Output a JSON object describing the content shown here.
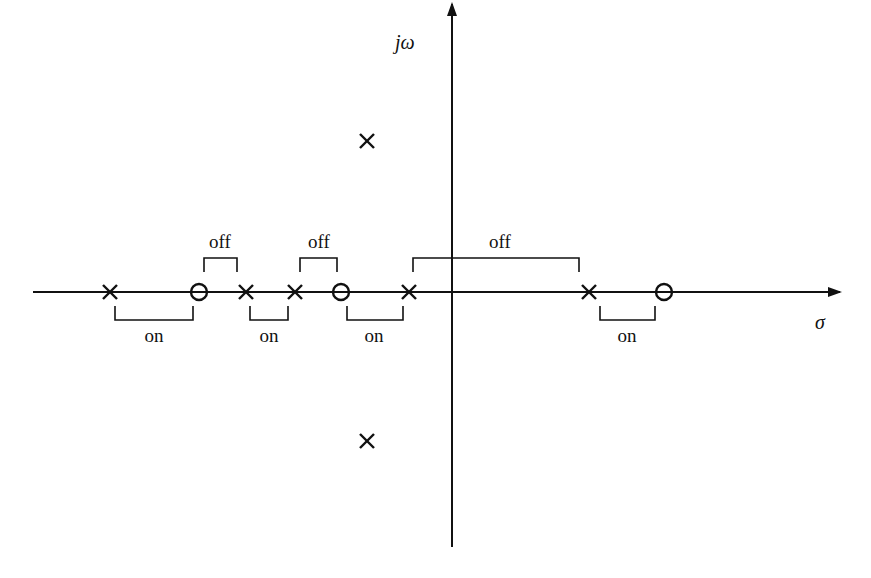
{
  "diagram": {
    "colors": {
      "stroke": "#111111",
      "background": "#ffffff"
    },
    "axes": {
      "real_axis_label": "σ",
      "imag_axis_label": "jω",
      "origin_px": [
        452,
        292
      ],
      "real_axis_px": {
        "x_start": 33,
        "x_end": 840
      },
      "imag_axis_px": {
        "y_top": 4,
        "y_bottom": 547
      }
    },
    "poles": [
      {
        "id": "p1",
        "x": 110,
        "y": 292
      },
      {
        "id": "p2",
        "x": 246,
        "y": 292
      },
      {
        "id": "p3",
        "x": 295,
        "y": 292
      },
      {
        "id": "p4",
        "x": 409,
        "y": 292
      },
      {
        "id": "p5",
        "x": 589,
        "y": 292
      },
      {
        "id": "p6",
        "x": 367,
        "y": 141
      },
      {
        "id": "p7",
        "x": 367,
        "y": 441
      }
    ],
    "zeros": [
      {
        "id": "z1",
        "x": 199,
        "y": 292
      },
      {
        "id": "z2",
        "x": 341,
        "y": 292
      },
      {
        "id": "z3",
        "x": 664,
        "y": 292
      }
    ],
    "segments_on": [
      {
        "label": "on",
        "x1": 115,
        "x2": 193,
        "label_x": 154
      },
      {
        "label": "on",
        "x1": 250,
        "x2": 288,
        "label_x": 269
      },
      {
        "label": "on",
        "x1": 347,
        "x2": 403,
        "label_x": 374
      },
      {
        "label": "on",
        "x1": 600,
        "x2": 655,
        "label_x": 627
      }
    ],
    "segments_off": [
      {
        "label": "off",
        "x1": 204,
        "x2": 237,
        "label_x": 220
      },
      {
        "label": "off",
        "x1": 300,
        "x2": 337,
        "label_x": 319
      },
      {
        "label": "off",
        "x1": 413,
        "x2": 579,
        "label_x": 500
      }
    ]
  }
}
